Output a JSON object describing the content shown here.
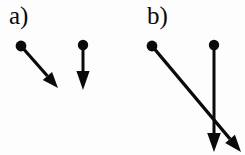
{
  "figure": {
    "background_color": "#fdfdfd",
    "ink_color": "#0a0a0a",
    "width": 245,
    "height": 155
  },
  "panels": [
    {
      "id": "a",
      "label": "a)",
      "label_x": 9,
      "label_y": 3,
      "vectors": [
        {
          "name": "vector-a1",
          "origin_x": 21,
          "origin_y": 46,
          "tip_x": 58,
          "tip_y": 88,
          "dot_radius": 5.4,
          "stroke_width": 3.2,
          "head_length": 16,
          "head_half_width": 6.2,
          "orientation": "diagonal-down-right"
        },
        {
          "name": "vector-a2",
          "origin_x": 83,
          "origin_y": 45,
          "tip_x": 83,
          "tip_y": 90,
          "dot_radius": 5.2,
          "stroke_width": 3.0,
          "head_length": 19,
          "head_half_width": 6.6,
          "orientation": "vertical-down"
        }
      ]
    },
    {
      "id": "b",
      "label": "b)",
      "label_x": 147,
      "label_y": 3,
      "vectors": [
        {
          "name": "vector-b1",
          "origin_x": 152,
          "origin_y": 46,
          "tip_x": 241,
          "tip_y": 152,
          "dot_radius": 5.4,
          "stroke_width": 3.4,
          "head_length": 17,
          "head_half_width": 6.4,
          "orientation": "diagonal-down-right"
        },
        {
          "name": "vector-b2",
          "origin_x": 214,
          "origin_y": 45,
          "tip_x": 214,
          "tip_y": 152,
          "dot_radius": 5.2,
          "stroke_width": 3.0,
          "head_length": 19,
          "head_half_width": 6.8,
          "orientation": "vertical-down"
        }
      ]
    }
  ]
}
